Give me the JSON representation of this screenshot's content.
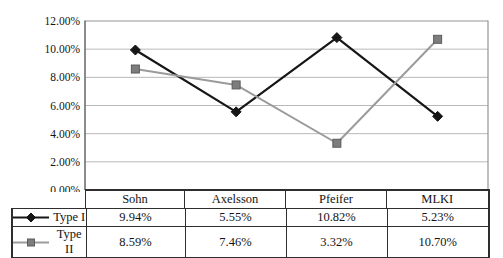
{
  "chart_data": {
    "type": "line",
    "title": "",
    "xlabel": "",
    "ylabel": "",
    "categories": [
      "Sohn",
      "Axelsson",
      "Pfeifer",
      "MLKI"
    ],
    "series": [
      {
        "name": "Type I",
        "values": [
          9.94,
          5.55,
          10.82,
          5.23
        ],
        "labels": [
          "9.94%",
          "5.55%",
          "10.82%",
          "5.23%"
        ],
        "marker": "diamond",
        "line_color": "#161616",
        "marker_fill": "#161616",
        "marker_stroke": "#161616",
        "line_width": 2.2
      },
      {
        "name": "Type II",
        "values": [
          8.59,
          7.46,
          3.32,
          10.7
        ],
        "labels": [
          "8.59%",
          "7.46%",
          "3.32%",
          "10.70%"
        ],
        "marker": "square",
        "line_color": "#9b9b9b",
        "marker_fill": "#7d7d7d",
        "marker_stroke": "#5c5c5c",
        "line_width": 2
      }
    ],
    "yticks": {
      "values": [
        0,
        2,
        4,
        6,
        8,
        10,
        12
      ],
      "labels": [
        "0.00%",
        "2.00%",
        "4.00%",
        "6.00%",
        "8.00%",
        "10.00%",
        "12.00%"
      ]
    },
    "ylim": [
      0,
      12
    ],
    "grid": true,
    "legend_position": "table-left",
    "colors": {
      "axis_text": "#141414",
      "gridline": "#b9b9b9",
      "plot_border": "#949494",
      "y_axis_line": "#6f6f6f",
      "table_border": "#2e2e2e"
    }
  }
}
